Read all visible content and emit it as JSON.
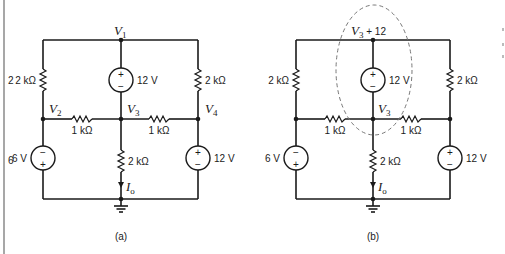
{
  "figure": {
    "page_margin_chars": [
      "2",
      "6"
    ],
    "circuits": [
      {
        "id": "a",
        "caption": "(a)",
        "node_labels": {
          "v1": {
            "base": "V",
            "sub": "1"
          },
          "v2": {
            "base": "V",
            "sub": "2"
          },
          "v3": {
            "base": "V",
            "sub": "3"
          },
          "v4": {
            "base": "V",
            "sub": "4"
          }
        },
        "components": {
          "r_left": "2 kΩ",
          "r_right": "2 kΩ",
          "r_mid_left": "1 kΩ",
          "r_mid_right": "1 kΩ",
          "r_center": "2 kΩ",
          "src_top": "12 V",
          "src_left": "6 V",
          "src_right": "12 V"
        },
        "current_label": {
          "base": "I",
          "sub": "o"
        },
        "polarity": {
          "plus": "+",
          "minus": "−"
        }
      },
      {
        "id": "b",
        "caption": "(b)",
        "node_labels": {
          "top": {
            "base": "V",
            "sub": "3",
            "suffix": " + 12"
          },
          "v3": {
            "base": "V",
            "sub": "3"
          }
        },
        "components": {
          "r_left": "2 kΩ",
          "r_right": "2 kΩ",
          "r_mid_left": "1 kΩ",
          "r_mid_right": "1 kΩ",
          "r_center": "2 kΩ",
          "src_top": "12 V",
          "src_left": "6 V",
          "src_right": "12 V"
        },
        "current_label": {
          "base": "I",
          "sub": "o"
        },
        "polarity": {
          "plus": "+",
          "minus": "−"
        },
        "supernode_outline": "dashed-ellipse"
      }
    ]
  }
}
